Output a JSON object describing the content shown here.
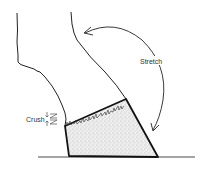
{
  "figure": {
    "labels": {
      "stretch": "Stretch",
      "crush": "Crush"
    },
    "colors": {
      "ink": "#222222",
      "hoof_fill": "#e6e6e6",
      "background": "#ffffff"
    }
  }
}
